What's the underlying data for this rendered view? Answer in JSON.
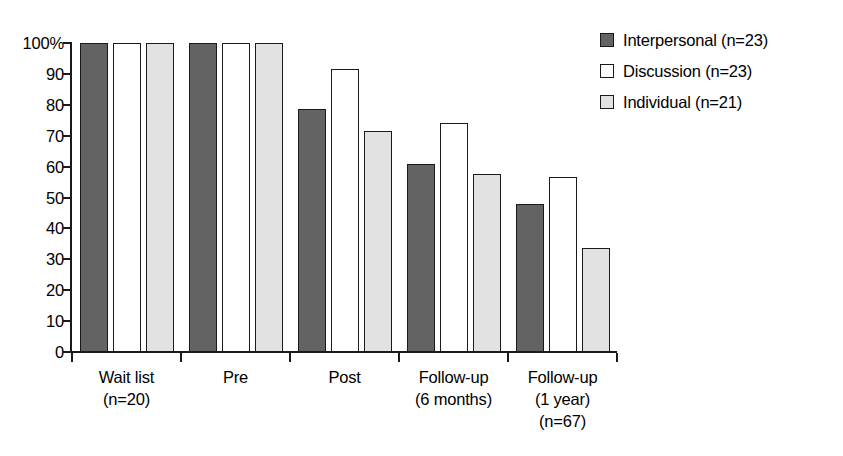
{
  "chart_data": {
    "type": "bar",
    "title": "",
    "subtitle": "",
    "xlabel": "",
    "ylabel": "",
    "ylim": [
      0,
      100
    ],
    "yticks": [
      0,
      10,
      20,
      30,
      40,
      50,
      60,
      70,
      80,
      90,
      100
    ],
    "ytick_labels": [
      "0",
      "10",
      "20",
      "30",
      "40",
      "50",
      "60",
      "70",
      "80",
      "90",
      "100%"
    ],
    "grid": false,
    "legend_position": "right-top",
    "categories": [
      "Wait list\n(n=20)",
      "Pre",
      "Post",
      "Follow-up\n(6 months)",
      "Follow-up\n(1 year)\n(n=67)"
    ],
    "series": [
      {
        "name": "Interpersonal (n=23)",
        "color": "#636363",
        "values": [
          100,
          100,
          78.5,
          61,
          48
        ]
      },
      {
        "name": "Discussion (n=23)",
        "color": "#ffffff",
        "values": [
          100,
          100,
          91.5,
          74,
          56.5
        ]
      },
      {
        "name": "Individual (n=21)",
        "color": "#e2e2e2",
        "values": [
          100,
          100,
          71.5,
          57.5,
          33.5
        ]
      }
    ]
  },
  "legend": {
    "items": [
      {
        "label": "Interpersonal (n=23)",
        "swatch": "legend-swatch-dark-gray"
      },
      {
        "label": "Discussion (n=23)",
        "swatch": "legend-swatch-white"
      },
      {
        "label": "Individual (n=21)",
        "swatch": "legend-swatch-light-gray"
      }
    ]
  }
}
